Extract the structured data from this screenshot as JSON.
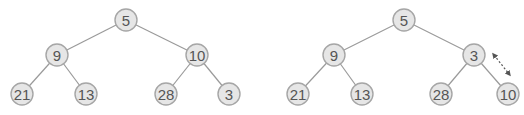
{
  "diagram": {
    "type": "binary-heap-swap",
    "before": {
      "nodes": [
        {
          "id": "b0",
          "value": "5",
          "x": 126,
          "y": 20
        },
        {
          "id": "b1",
          "value": "9",
          "x": 57,
          "y": 55
        },
        {
          "id": "b2",
          "value": "10",
          "x": 197,
          "y": 55
        },
        {
          "id": "b3",
          "value": "21",
          "x": 22,
          "y": 94
        },
        {
          "id": "b4",
          "value": "13",
          "x": 86,
          "y": 94
        },
        {
          "id": "b5",
          "value": "28",
          "x": 166,
          "y": 94
        },
        {
          "id": "b6",
          "value": "3",
          "x": 229,
          "y": 94
        }
      ],
      "edges": [
        [
          "b0",
          "b1"
        ],
        [
          "b0",
          "b2"
        ],
        [
          "b1",
          "b3"
        ],
        [
          "b1",
          "b4"
        ],
        [
          "b2",
          "b5"
        ],
        [
          "b2",
          "b6"
        ]
      ]
    },
    "after": {
      "nodes": [
        {
          "id": "a0",
          "value": "5",
          "x": 404,
          "y": 20
        },
        {
          "id": "a1",
          "value": "9",
          "x": 334,
          "y": 55
        },
        {
          "id": "a2",
          "value": "3",
          "x": 474,
          "y": 55
        },
        {
          "id": "a3",
          "value": "21",
          "x": 298,
          "y": 94
        },
        {
          "id": "a4",
          "value": "13",
          "x": 362,
          "y": 94
        },
        {
          "id": "a5",
          "value": "28",
          "x": 441,
          "y": 94
        },
        {
          "id": "a6",
          "value": "10",
          "x": 508,
          "y": 94
        }
      ],
      "edges": [
        [
          "a0",
          "a1"
        ],
        [
          "a0",
          "a2"
        ],
        [
          "a1",
          "a3"
        ],
        [
          "a1",
          "a4"
        ],
        [
          "a2",
          "a5"
        ],
        [
          "a2",
          "a6"
        ]
      ],
      "swap_arrow": {
        "from": [
          494,
          55
        ],
        "to": [
          509,
          74
        ],
        "style": "dotted-double-arrow"
      }
    },
    "node_radius": 11,
    "colors": {
      "node_fill": "#e6e6e6",
      "node_stroke": "#a6a6a6",
      "edge": "#9a9a9a",
      "text": "#555555"
    }
  }
}
